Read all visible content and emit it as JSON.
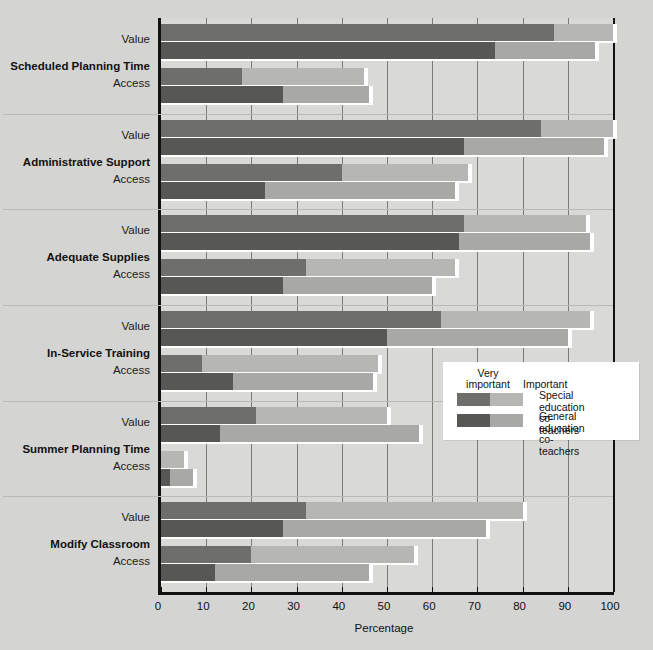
{
  "chart_data": {
    "type": "bar",
    "orientation": "horizontal",
    "stacked": true,
    "title": "",
    "xlabel": "Percentage",
    "ylabel": "",
    "xlim": [
      0,
      100
    ],
    "xticks": [
      0,
      10,
      20,
      30,
      40,
      50,
      60,
      70,
      80,
      90,
      100
    ],
    "grid": true,
    "legend_position": "middle-right",
    "segments": [
      "Very important",
      "Important"
    ],
    "series": [
      {
        "name": "Special education co-teachers",
        "colors": [
          "#6e6e6c",
          "#b6b6b4"
        ]
      },
      {
        "name": "General education co-teachers",
        "colors": [
          "#575755",
          "#a8a8a6"
        ]
      }
    ],
    "categories": [
      "Scheduled Planning Time",
      "Administrative Support",
      "Adequate Supplies",
      "In-Service Training",
      "Summer Planning Time",
      "Modify Classroom"
    ],
    "subcategories": [
      "Value",
      "Access"
    ],
    "groups": [
      {
        "category": "Scheduled Planning Time",
        "rows": [
          {
            "subcategory": "Value",
            "bars": [
              {
                "series": "Special education co-teachers",
                "very_important": 87,
                "important": 13,
                "total": 100
              },
              {
                "series": "General education co-teachers",
                "very_important": 74,
                "important": 22,
                "total": 96
              }
            ]
          },
          {
            "subcategory": "Access",
            "bars": [
              {
                "series": "Special education co-teachers",
                "very_important": 18,
                "important": 27,
                "total": 45
              },
              {
                "series": "General education co-teachers",
                "very_important": 27,
                "important": 19,
                "total": 46
              }
            ]
          }
        ]
      },
      {
        "category": "Administrative Support",
        "rows": [
          {
            "subcategory": "Value",
            "bars": [
              {
                "series": "Special education co-teachers",
                "very_important": 84,
                "important": 16,
                "total": 100
              },
              {
                "series": "General education co-teachers",
                "very_important": 67,
                "important": 31,
                "total": 98
              }
            ]
          },
          {
            "subcategory": "Access",
            "bars": [
              {
                "series": "Special education co-teachers",
                "very_important": 40,
                "important": 28,
                "total": 68
              },
              {
                "series": "General education co-teachers",
                "very_important": 23,
                "important": 42,
                "total": 65
              }
            ]
          }
        ]
      },
      {
        "category": "Adequate Supplies",
        "rows": [
          {
            "subcategory": "Value",
            "bars": [
              {
                "series": "Special education co-teachers",
                "very_important": 67,
                "important": 27,
                "total": 94
              },
              {
                "series": "General education co-teachers",
                "very_important": 66,
                "important": 29,
                "total": 95
              }
            ]
          },
          {
            "subcategory": "Access",
            "bars": [
              {
                "series": "Special education co-teachers",
                "very_important": 32,
                "important": 33,
                "total": 65
              },
              {
                "series": "General education co-teachers",
                "very_important": 27,
                "important": 33,
                "total": 60
              }
            ]
          }
        ]
      },
      {
        "category": "In-Service Training",
        "rows": [
          {
            "subcategory": "Value",
            "bars": [
              {
                "series": "Special education co-teachers",
                "very_important": 62,
                "important": 33,
                "total": 95
              },
              {
                "series": "General education co-teachers",
                "very_important": 50,
                "important": 40,
                "total": 90
              }
            ]
          },
          {
            "subcategory": "Access",
            "bars": [
              {
                "series": "Special education co-teachers",
                "very_important": 9,
                "important": 39,
                "total": 48
              },
              {
                "series": "General education co-teachers",
                "very_important": 16,
                "important": 31,
                "total": 47
              }
            ]
          }
        ]
      },
      {
        "category": "Summer Planning Time",
        "rows": [
          {
            "subcategory": "Value",
            "bars": [
              {
                "series": "Special education co-teachers",
                "very_important": 21,
                "important": 29,
                "total": 50
              },
              {
                "series": "General education co-teachers",
                "very_important": 13,
                "important": 44,
                "total": 57
              }
            ]
          },
          {
            "subcategory": "Access",
            "bars": [
              {
                "series": "Special education co-teachers",
                "very_important": 0,
                "important": 5,
                "total": 5
              },
              {
                "series": "General education co-teachers",
                "very_important": 2,
                "important": 5,
                "total": 7
              }
            ]
          }
        ]
      },
      {
        "category": "Modify Classroom",
        "rows": [
          {
            "subcategory": "Value",
            "bars": [
              {
                "series": "Special education co-teachers",
                "very_important": 32,
                "important": 48,
                "total": 80
              },
              {
                "series": "General education co-teachers",
                "very_important": 27,
                "important": 45,
                "total": 72
              }
            ]
          },
          {
            "subcategory": "Access",
            "bars": [
              {
                "series": "Special education co-teachers",
                "very_important": 20,
                "important": 36,
                "total": 56
              },
              {
                "series": "General education co-teachers",
                "very_important": 12,
                "important": 34,
                "total": 46
              }
            ]
          }
        ]
      }
    ]
  },
  "axis": {
    "x_title": "Percentage",
    "x_tick_labels": [
      "0",
      "10",
      "20",
      "30",
      "40",
      "50",
      "60",
      "70",
      "80",
      "90",
      "100"
    ]
  },
  "legend": {
    "header_very": "Very\nimportant",
    "header_very_line1": "Very",
    "header_very_line2": "important",
    "header_important": "Important",
    "rows": [
      {
        "label_line1": "Special education",
        "label_line2": "co-teachers",
        "very_color": "#6e6e6c",
        "important_color": "#b6b6b4"
      },
      {
        "label_line1": "General education",
        "label_line2": "co-teachers",
        "very_color": "#575755",
        "important_color": "#a8a8a6"
      }
    ]
  }
}
